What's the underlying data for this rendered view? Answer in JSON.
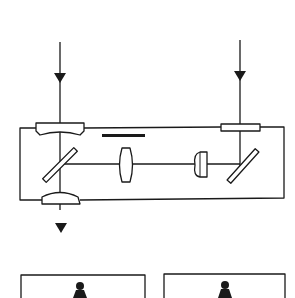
{
  "diagram": {
    "type": "optical-schematic",
    "colors": {
      "stroke": "#1a1a1a",
      "background": "#ffffff",
      "fill": "#1a1a1a"
    },
    "elements": {
      "input_beam_left": {
        "label": "input-beam-left",
        "direction": "down"
      },
      "input_beam_right": {
        "label": "input-beam-right",
        "direction": "down"
      },
      "housing": {
        "label": "optical-housing"
      },
      "top_left_window": {
        "label": "meniscus-window"
      },
      "top_right_window": {
        "label": "flat-window"
      },
      "filter_bar": {
        "label": "filter"
      },
      "left_mirror": {
        "label": "beam-splitter-mirror-left"
      },
      "right_mirror": {
        "label": "fold-mirror-right"
      },
      "center_lens": {
        "label": "biconvex-lens"
      },
      "plano_convex_lens": {
        "label": "plano-convex-lens"
      },
      "bottom_lens": {
        "label": "output-lens"
      },
      "output_beam": {
        "label": "output-beam",
        "direction": "down"
      },
      "panels": [
        {
          "label": "display-panel-left",
          "icon": "person-icon"
        },
        {
          "label": "display-panel-right",
          "icon": "person-icon"
        }
      ]
    }
  }
}
